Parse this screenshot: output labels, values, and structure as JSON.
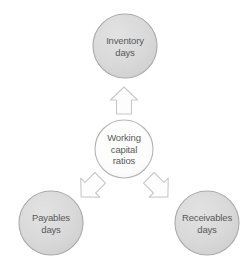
{
  "diagram": {
    "type": "hub-and-spoke",
    "title": "Working capital ratios",
    "background_color": "#ffffff",
    "node_fill_outer": "#d8d8d8",
    "node_fill_center": "#fbfbfb",
    "node_stroke": "#a8a8a8",
    "arrow_fill": "#fdfdfd",
    "arrow_stroke": "#c4c4c4",
    "text_color": "#58585a",
    "nodes": [
      {
        "id": "inventory-days",
        "lines": [
          "Inventory",
          "days"
        ],
        "cx": 125,
        "cy": 46,
        "r": 32,
        "role": "spoke",
        "position": "top"
      },
      {
        "id": "working-capital-ratios",
        "lines": [
          "Working",
          "capital",
          "ratios"
        ],
        "cx": 124,
        "cy": 149,
        "r": 29,
        "role": "hub",
        "position": "center"
      },
      {
        "id": "payables-days",
        "lines": [
          "Payables",
          "days"
        ],
        "cx": 51,
        "cy": 223,
        "r": 32,
        "role": "spoke",
        "position": "bottom-left"
      },
      {
        "id": "receivables-days",
        "lines": [
          "Receivables",
          "days"
        ],
        "cx": 207,
        "cy": 223,
        "r": 32,
        "role": "spoke",
        "position": "bottom-right"
      }
    ],
    "arrows": [
      {
        "id": "arrow-to-inventory",
        "from": "working-capital-ratios",
        "to": "inventory-days",
        "direction": "up",
        "rotation_deg": 0,
        "cx": 124,
        "cy": 101
      },
      {
        "id": "arrow-to-payables",
        "from": "working-capital-ratios",
        "to": "payables-days",
        "direction": "down-left",
        "rotation_deg": -135,
        "cx": 91,
        "cy": 187
      },
      {
        "id": "arrow-to-receivables",
        "from": "working-capital-ratios",
        "to": "receivables-days",
        "direction": "down-right",
        "rotation_deg": 135,
        "cx": 158,
        "cy": 187
      }
    ]
  }
}
